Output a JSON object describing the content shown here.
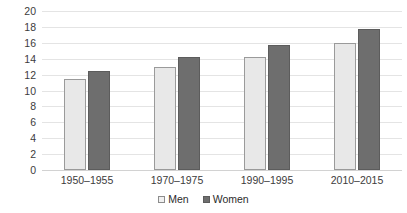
{
  "chart_data": {
    "type": "bar",
    "title": "",
    "subtitle": "",
    "xlabel": "",
    "ylabel": "",
    "ylim": [
      0,
      20
    ],
    "y_ticks": [
      0,
      2,
      4,
      6,
      8,
      10,
      12,
      14,
      16,
      18,
      20
    ],
    "grid": true,
    "legend_position": "bottom",
    "categories": [
      "1950–1955",
      "1970–1975",
      "1990–1995",
      "2010–2015"
    ],
    "series": [
      {
        "name": "Men",
        "color": "#E8E8E8",
        "values": [
          11.4,
          12.9,
          14.2,
          16.0
        ]
      },
      {
        "name": "Women",
        "color": "#6E6E6E",
        "values": [
          12.5,
          14.2,
          15.7,
          17.7
        ]
      }
    ]
  }
}
